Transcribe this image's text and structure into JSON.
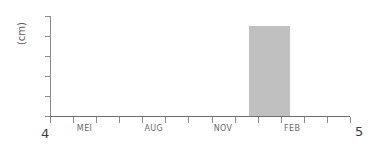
{
  "chart_data": {
    "type": "bar",
    "title": "",
    "subtitle": "",
    "xlabel": "",
    "ylabel": "(cm)",
    "ylim": [
      0,
      50
    ],
    "grid": false,
    "legend": null,
    "y_ticks": [
      0,
      10,
      20,
      30,
      40,
      50
    ],
    "y_tick_labels": [
      "0",
      "10",
      "20",
      "30",
      "40",
      "50"
    ],
    "x_tick_labels": [
      "",
      "MEI",
      "",
      "",
      "AUG",
      "",
      "",
      "NOV",
      "",
      "",
      "FEB",
      "",
      ""
    ],
    "categories": [
      "APR",
      "MEI",
      "JUN",
      "JUL",
      "AUG",
      "SEP",
      "OCT",
      "NOV",
      "DEC",
      "JAN",
      "FEB",
      "MAR",
      "APR"
    ],
    "values": [
      0,
      0,
      0,
      0,
      0,
      0,
      0,
      0,
      0,
      45,
      0,
      0,
      0
    ],
    "bar_color": "#c0c0c0",
    "annotations": {
      "corner_bottom_left": "4",
      "corner_bottom_right": "5"
    }
  },
  "colors": {
    "bar": "#c0c0c0",
    "axis": "#8c8c8c",
    "tick_text": "#4a4a4a",
    "month_text": "#6a6a6a",
    "corner_text": "#3d3d3d",
    "background": "#ffffff"
  }
}
